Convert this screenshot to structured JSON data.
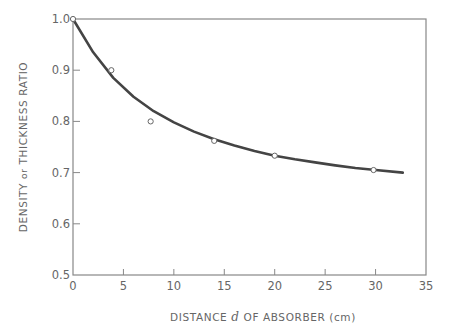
{
  "chart_data": {
    "type": "scatter",
    "title": "",
    "xlabel": "DISTANCE d OF ABSORBER (cm)",
    "xlabel_parts": {
      "before": "DISTANCE ",
      "italic": "d",
      "after": " OF ABSORBER (cm)"
    },
    "ylabel": "DENSITY or THICKNESS RATIO",
    "ylabel_parts": {
      "before": "DENSITY ",
      "small": "or",
      "after": " THICKNESS RATIO"
    },
    "xlim": [
      0,
      35
    ],
    "ylim": [
      0.5,
      1.0
    ],
    "xticks": [
      0,
      5,
      10,
      15,
      20,
      25,
      30,
      35
    ],
    "xtick_labels": [
      "0",
      "5",
      "10",
      "15",
      "20",
      "25",
      "30",
      "35"
    ],
    "yticks": [
      0.5,
      0.6,
      0.7,
      0.8,
      0.9,
      1.0
    ],
    "ytick_labels": [
      "0.5",
      "0.6",
      "0.7",
      "0.8",
      "0.9",
      "1.0"
    ],
    "grid": false,
    "legend": null,
    "series": [
      {
        "name": "measured",
        "style": "open-circle markers",
        "x": [
          0,
          3.8,
          7.7,
          14,
          20,
          29.8
        ],
        "y": [
          1.0,
          0.9,
          0.8,
          0.762,
          0.733,
          0.705
        ]
      },
      {
        "name": "fitted curve",
        "style": "solid thick line",
        "x": [
          0,
          2,
          4,
          6,
          8,
          10,
          12,
          14,
          16,
          18,
          20,
          22,
          24,
          26,
          28,
          30,
          32.7
        ],
        "y": [
          1.0,
          0.935,
          0.885,
          0.848,
          0.82,
          0.798,
          0.78,
          0.765,
          0.753,
          0.742,
          0.733,
          0.726,
          0.72,
          0.714,
          0.709,
          0.705,
          0.7
        ]
      }
    ],
    "colors": {
      "axis": "#888888",
      "curve": "#444444",
      "marker": "#666666",
      "text": "#666666"
    }
  }
}
